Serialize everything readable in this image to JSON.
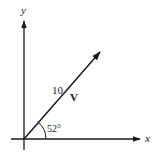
{
  "diagram": {
    "type": "vector",
    "axes": {
      "x_label": "x",
      "y_label": "y"
    },
    "vector": {
      "name": "V",
      "magnitude_label": "10",
      "angle_label": "52°",
      "angle_degrees": 52
    },
    "colors": {
      "stroke": "#1a1a1a",
      "background": "#ffffff"
    }
  }
}
